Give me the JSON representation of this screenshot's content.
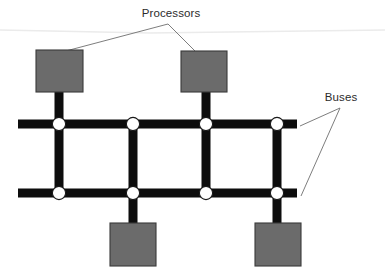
{
  "figure": {
    "background_color": "#ffffff",
    "width": 385,
    "height": 277
  },
  "colors": {
    "bus_color": "#0d0d0d",
    "processor_fill": "#6b6b6b",
    "processor_stroke": "#3a3a3a",
    "node_fill": "#ffffff",
    "node_stroke": "#1a1a1a",
    "leader_line_color": "#6e6e6e",
    "text_color": "#2b2b2b",
    "artifact_line_color": "#ebebeb"
  },
  "labels": {
    "processors": {
      "text": "Processors",
      "x": 171,
      "y": 17,
      "anchor": "middle",
      "font_size": 11.5
    },
    "buses": {
      "text": "Buses",
      "x": 341,
      "y": 101,
      "anchor": "middle",
      "font_size": 11.5
    }
  },
  "leader_lines": {
    "processors": {
      "apex": {
        "x": 168,
        "y": 24
      },
      "targets": [
        {
          "x": 62,
          "y": 52,
          "name": "processor-top-left"
        },
        {
          "x": 196,
          "y": 52,
          "name": "processor-top-right"
        }
      ]
    },
    "buses": {
      "apex": {
        "x": 340,
        "y": 108
      },
      "targets": [
        {
          "x": 300,
          "y": 126,
          "name": "bus-row-top"
        },
        {
          "x": 301,
          "y": 196,
          "name": "bus-row-bottom"
        }
      ]
    }
  },
  "artifact_line": {
    "points": "0,30 150,33 385,30",
    "description": "faint scan artifact across upper area"
  },
  "buses": {
    "bar_thickness": 9,
    "horizontal": [
      {
        "name": "bus-row-top",
        "y": 124,
        "x1": 18,
        "x2": 297
      },
      {
        "name": "bus-row-bottom",
        "y": 193,
        "x1": 18,
        "x2": 297
      }
    ],
    "vertical_connectors": [
      {
        "name": "bus-col-1",
        "x": 59,
        "y1": 124,
        "y2": 193
      },
      {
        "name": "bus-col-2",
        "x": 133,
        "y1": 124,
        "y2": 193
      },
      {
        "name": "bus-col-3",
        "x": 206,
        "y1": 124,
        "y2": 193
      },
      {
        "name": "bus-col-4",
        "x": 277,
        "y1": 124,
        "y2": 193
      }
    ],
    "processor_stubs": [
      {
        "name": "stub-top-left",
        "x": 59,
        "y1": 92,
        "y2": 124
      },
      {
        "name": "stub-top-right",
        "x": 206,
        "y1": 92,
        "y2": 124
      },
      {
        "name": "stub-bottom-left",
        "x": 133,
        "y1": 193,
        "y2": 224
      },
      {
        "name": "stub-bottom-right",
        "x": 277,
        "y1": 193,
        "y2": 224
      }
    ]
  },
  "nodes": {
    "radius": 6.6,
    "items": [
      {
        "name": "node-r1c1",
        "x": 59,
        "y": 124
      },
      {
        "name": "node-r1c2",
        "x": 133,
        "y": 124
      },
      {
        "name": "node-r1c3",
        "x": 206,
        "y": 124
      },
      {
        "name": "node-r1c4",
        "x": 277,
        "y": 124
      },
      {
        "name": "node-r2c1",
        "x": 59,
        "y": 193
      },
      {
        "name": "node-r2c2",
        "x": 133,
        "y": 193
      },
      {
        "name": "node-r2c3",
        "x": 206,
        "y": 193
      },
      {
        "name": "node-r2c4",
        "x": 277,
        "y": 193
      }
    ]
  },
  "processors": [
    {
      "name": "processor-top-left",
      "x": 36,
      "y": 50,
      "width": 47,
      "height": 42
    },
    {
      "name": "processor-top-right",
      "x": 181,
      "y": 51,
      "width": 46,
      "height": 41
    },
    {
      "name": "processor-bottom-left",
      "x": 110,
      "y": 223,
      "width": 46,
      "height": 43
    },
    {
      "name": "processor-bottom-right",
      "x": 255,
      "y": 223,
      "width": 46,
      "height": 43
    }
  ]
}
